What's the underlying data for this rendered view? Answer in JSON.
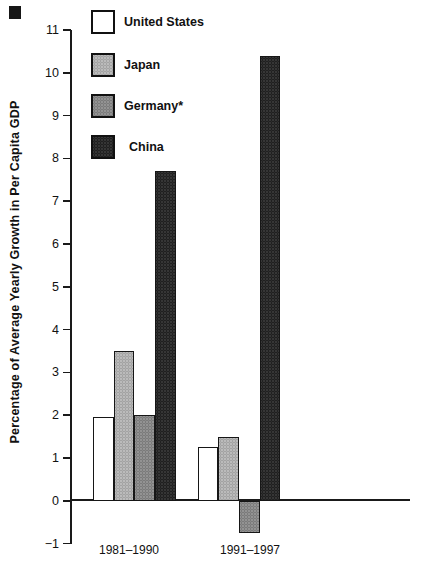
{
  "chart_data": {
    "type": "bar",
    "title": "",
    "xlabel": "",
    "ylabel": "Percentage of Average Yearly Growth in Per Capita GDP",
    "categories": [
      "1981–1990",
      "1991–1997"
    ],
    "series": [
      {
        "name": "United States",
        "values": [
          1.95,
          1.25
        ],
        "color": "#ffffff",
        "dot": "rgba(0,0,0,0)"
      },
      {
        "name": "Japan",
        "values": [
          3.5,
          1.5
        ],
        "color": "#dcdcdc",
        "dot": "rgba(110,110,110,0.40)"
      },
      {
        "name": "Germany*",
        "values": [
          2.0,
          -0.75
        ],
        "color": "#b2b2b2",
        "dot": "rgba(60,60,60,0.35)"
      },
      {
        "name": "China",
        "values": [
          7.7,
          10.4
        ],
        "color": "#575757",
        "dot": "rgba(0,0,0,0.50)"
      }
    ],
    "ylim": [
      -1,
      11
    ],
    "yticks": [
      11,
      10,
      9,
      8,
      7,
      6,
      5,
      4,
      3,
      2,
      1,
      0,
      -1
    ],
    "ytick_labels": [
      "11",
      "10",
      "9",
      "8",
      "7",
      "6",
      "5",
      "4",
      "3",
      "2",
      "1",
      "0",
      "−1"
    ],
    "grid": false,
    "legend_position": "upper-left",
    "axis_color": "#1a1a1a",
    "bar_border_color": "#161616",
    "background_color": "#ffffff"
  }
}
